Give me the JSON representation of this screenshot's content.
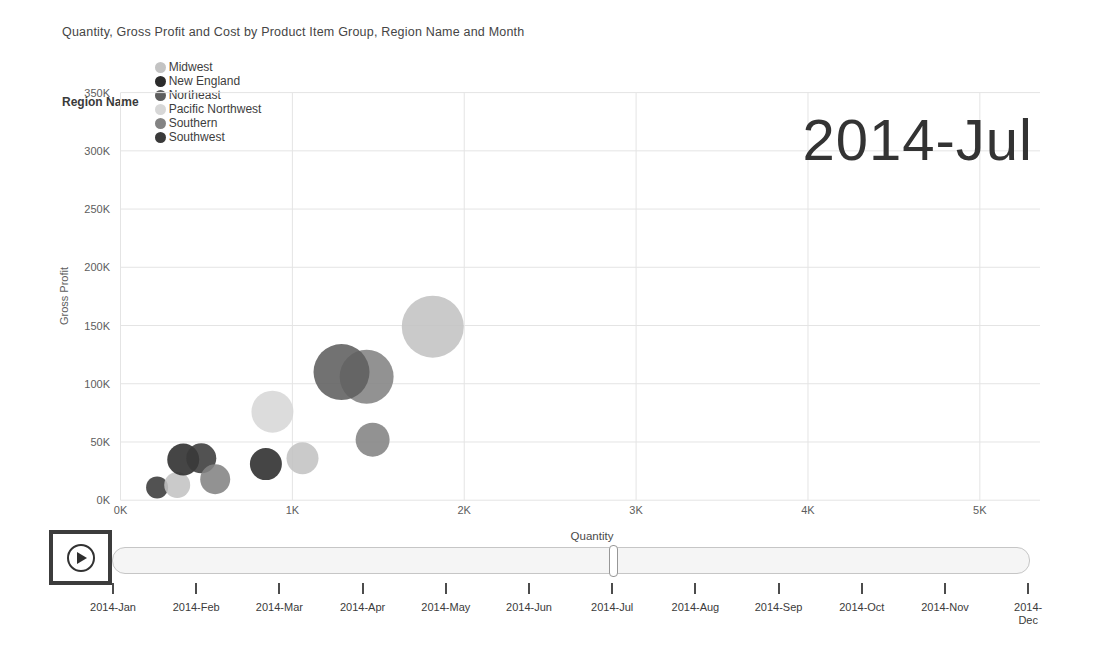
{
  "title": "Quantity, Gross Profit and Cost by Product Item Group, Region Name and Month",
  "legend": {
    "title": "Region Name",
    "items": [
      {
        "label": "Midwest",
        "color": "#c3c3c3"
      },
      {
        "label": "New England",
        "color": "#2b2b2b"
      },
      {
        "label": "Northeast",
        "color": "#5e5e5e"
      },
      {
        "label": "Pacific Northwest",
        "color": "#d7d7d7"
      },
      {
        "label": "Southern",
        "color": "#838383"
      },
      {
        "label": "Southwest",
        "color": "#3a3a3a"
      }
    ]
  },
  "chart_data": {
    "type": "scatter",
    "title": "Quantity, Gross Profit and Cost by Product Item Group, Region Name and Month",
    "xlabel": "Quantity",
    "ylabel": "Gross Profit",
    "frame_label": "2014-Jul",
    "legend_title": "Region Name",
    "legend_position": "top",
    "grid": true,
    "xlim": [
      0,
      5350
    ],
    "ylim": [
      0,
      350000
    ],
    "x_ticks": [
      {
        "label": "0K",
        "value": 0
      },
      {
        "label": "1K",
        "value": 1000
      },
      {
        "label": "2K",
        "value": 2000
      },
      {
        "label": "3K",
        "value": 3000
      },
      {
        "label": "4K",
        "value": 4000
      },
      {
        "label": "5K",
        "value": 5000
      }
    ],
    "y_ticks": [
      {
        "label": "0K",
        "value": 0
      },
      {
        "label": "50K",
        "value": 50000
      },
      {
        "label": "100K",
        "value": 100000
      },
      {
        "label": "150K",
        "value": 150000
      },
      {
        "label": "200K",
        "value": 200000
      },
      {
        "label": "250K",
        "value": 250000
      },
      {
        "label": "300K",
        "value": 300000
      },
      {
        "label": "350K",
        "value": 350000
      }
    ],
    "size_legend": "bubble size = Cost",
    "points": [
      {
        "region": "Southwest",
        "x": 213,
        "y": 11000,
        "r": 11
      },
      {
        "region": "Midwest",
        "x": 330,
        "y": 13000,
        "r": 13
      },
      {
        "region": "New England",
        "x": 365,
        "y": 35000,
        "r": 16
      },
      {
        "region": "Southwest",
        "x": 470,
        "y": 36000,
        "r": 15
      },
      {
        "region": "Southern",
        "x": 551,
        "y": 18000,
        "r": 15
      },
      {
        "region": "New England",
        "x": 846,
        "y": 31000,
        "r": 16
      },
      {
        "region": "Pacific Northwest",
        "x": 884,
        "y": 76000,
        "r": 21
      },
      {
        "region": "Midwest",
        "x": 1059,
        "y": 36000,
        "r": 16
      },
      {
        "region": "Southern",
        "x": 1467,
        "y": 52000,
        "r": 17
      },
      {
        "region": "Southern",
        "x": 1432,
        "y": 106000,
        "r": 27
      },
      {
        "region": "Northeast",
        "x": 1286,
        "y": 110000,
        "r": 28
      },
      {
        "region": "Midwest",
        "x": 1817,
        "y": 149000,
        "r": 31
      }
    ]
  },
  "play_axis": {
    "current_frame": "2014-Jul",
    "months": [
      "2014-Jan",
      "2014-Feb",
      "2014-Mar",
      "2014-Apr",
      "2014-May",
      "2014-Jun",
      "2014-Jul",
      "2014-Aug",
      "2014-Sep",
      "2014-Oct",
      "2014-Nov",
      "2014-Dec"
    ]
  }
}
